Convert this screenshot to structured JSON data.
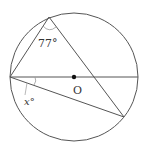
{
  "diagram": {
    "type": "circle-geometry",
    "circle": {
      "cx": 74,
      "cy": 77,
      "r": 64
    },
    "center_label": "O",
    "points": {
      "top": {
        "x": 49,
        "y": 17
      },
      "left": {
        "x": 10,
        "y": 77
      },
      "right": {
        "x": 138,
        "y": 77
      },
      "bottom_right": {
        "x": 124,
        "y": 117
      },
      "center": {
        "x": 74,
        "y": 77
      }
    },
    "angle_labels": {
      "top_angle": "77°",
      "x_angle": "x°"
    },
    "colors": {
      "stroke": "#555555",
      "text": "#333333",
      "arc": "#999999"
    }
  }
}
